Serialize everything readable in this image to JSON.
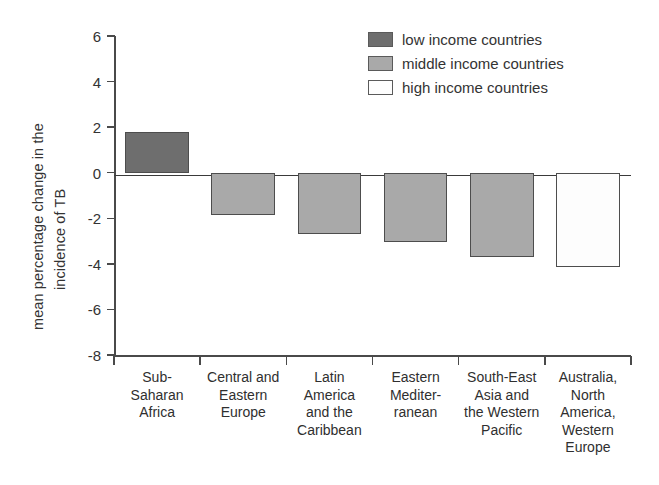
{
  "chart_data": {
    "type": "bar",
    "title": "",
    "subtitle": "",
    "xlabel": "",
    "ylabel": "mean percentage change in the incidence of TB",
    "ylabel_lines": [
      "mean percentage change in the",
      "incidence of TB"
    ],
    "ylim": [
      -8,
      6
    ],
    "yticks": [
      6,
      4,
      2,
      0,
      -2,
      -4,
      -6,
      -8
    ],
    "ytick_labels": [
      "6",
      "4",
      "2",
      "0",
      "-2",
      "-4",
      "-6",
      "-8"
    ],
    "grid": false,
    "legend_position": "top-right",
    "zero_line": true,
    "categories": [
      "Sub-Saharan Africa",
      "Central and Eastern Europe",
      "Latin America and the Caribbean",
      "Eastern Mediterranean",
      "South-East Asia and the Western Pacific",
      "Australia, North America, Western Europe"
    ],
    "category_label_lines": [
      [
        "Sub-",
        "Saharan",
        "Africa"
      ],
      [
        "Central and",
        "Eastern",
        "Europe"
      ],
      [
        "Latin",
        "America",
        "and the",
        "Caribbean"
      ],
      [
        "Eastern",
        "Mediter-",
        "ranean"
      ],
      [
        "South-East",
        "Asia and",
        "the Western",
        "Pacific"
      ],
      [
        "Australia,",
        "North",
        "America,",
        "Western",
        "Europe"
      ]
    ],
    "values": [
      1.8,
      -1.85,
      -2.7,
      -3.05,
      -3.7,
      -4.15
    ],
    "bar_groups": [
      "low income countries",
      "middle income countries",
      "middle income countries",
      "middle income countries",
      "middle income countries",
      "high income countries"
    ],
    "bar_colors": [
      "#6e6e6e",
      "#a9a9a9",
      "#a9a9a9",
      "#a9a9a9",
      "#a9a9a9",
      "#fdfdfd"
    ],
    "series": [
      {
        "name": "low income countries",
        "color": "#6e6e6e",
        "points": [
          {
            "category": "Sub-Saharan Africa",
            "value": 1.8
          }
        ]
      },
      {
        "name": "middle income countries",
        "color": "#a9a9a9",
        "points": [
          {
            "category": "Central and Eastern Europe",
            "value": -1.85
          },
          {
            "category": "Latin America and the Caribbean",
            "value": -2.7
          },
          {
            "category": "Eastern Mediterranean",
            "value": -3.05
          },
          {
            "category": "South-East Asia and the Western Pacific",
            "value": -3.7
          }
        ]
      },
      {
        "name": "high income countries",
        "color": "#fdfdfd",
        "points": [
          {
            "category": "Australia, North America, Western Europe",
            "value": -4.15
          }
        ]
      }
    ]
  },
  "legend": {
    "items": [
      {
        "label": "low income countries",
        "color": "#6e6e6e"
      },
      {
        "label": "middle income countries",
        "color": "#a9a9a9"
      },
      {
        "label": "high income countries",
        "color": "#fdfdfd"
      }
    ]
  },
  "colors": {
    "low_income": "#6e6e6e",
    "middle_income": "#a9a9a9",
    "high_income": "#fdfdfd",
    "axis": "#4a4a4a",
    "bar_border": "#4d4d4d",
    "text": "#2f2f2f",
    "background": "#ffffff"
  }
}
